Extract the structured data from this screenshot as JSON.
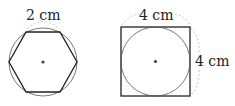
{
  "figures": [
    {
      "shape": "regular hexagon inscribed in circle",
      "label": "2 cm",
      "label_refers_to": "side length of hexagon"
    },
    {
      "shape": "circle inscribed in square",
      "labels": {
        "top": "4 cm",
        "right": "4 cm"
      }
    }
  ],
  "colors": {
    "stroke": "#333333",
    "dashed": "#999999"
  }
}
